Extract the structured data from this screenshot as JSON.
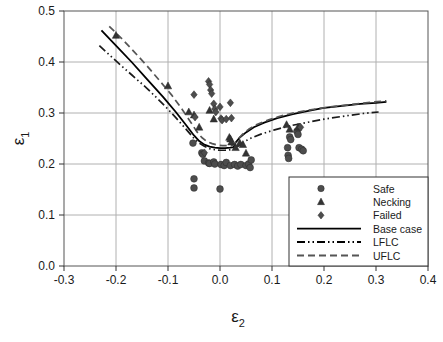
{
  "chart_data": {
    "type": "scatter",
    "title": "",
    "xlabel": "ε₂",
    "ylabel": "ε₁",
    "xlim": [
      -0.3,
      0.4
    ],
    "ylim": [
      0.0,
      0.5
    ],
    "xticks": [
      "-0.3",
      "-0.2",
      "-0.1",
      "0.0",
      "0.1",
      "0.2",
      "0.3",
      "0.4"
    ],
    "xtick_values": [
      -0.3,
      -0.2,
      -0.1,
      0.0,
      0.1,
      0.2,
      0.3,
      0.4
    ],
    "yticks": [
      "0.0",
      "0.1",
      "0.2",
      "0.3",
      "0.4",
      "0.5"
    ],
    "ytick_values": [
      0.0,
      0.1,
      0.2,
      0.3,
      0.4,
      0.5
    ],
    "grid": true,
    "legend_position": "lower-right",
    "series": [
      {
        "name": "Safe",
        "marker": "circle",
        "color": "#4d4d4d",
        "points": [
          [
            -0.052,
            0.241
          ],
          [
            -0.05,
            0.171
          ],
          [
            -0.05,
            0.153
          ],
          [
            -0.035,
            0.222
          ],
          [
            -0.033,
            0.219
          ],
          [
            -0.03,
            0.206
          ],
          [
            -0.022,
            0.202
          ],
          [
            -0.02,
            0.201
          ],
          [
            -0.012,
            0.204
          ],
          [
            -0.01,
            0.2
          ],
          [
            0.0,
            0.151
          ],
          [
            0.002,
            0.199
          ],
          [
            0.008,
            0.197
          ],
          [
            0.012,
            0.203
          ],
          [
            0.02,
            0.197
          ],
          [
            0.028,
            0.199
          ],
          [
            0.034,
            0.196
          ],
          [
            0.04,
            0.199
          ],
          [
            0.05,
            0.197
          ],
          [
            0.055,
            0.2
          ],
          [
            0.058,
            0.193
          ],
          [
            0.06,
            0.208
          ],
          [
            0.13,
            0.232
          ],
          [
            0.131,
            0.217
          ],
          [
            0.132,
            0.211
          ],
          [
            0.134,
            0.253
          ],
          [
            0.136,
            0.248
          ],
          [
            0.152,
            0.232
          ],
          [
            0.157,
            0.229
          ],
          [
            0.16,
            0.226
          ],
          [
            0.148,
            0.264
          ],
          [
            0.15,
            0.258
          ]
        ]
      },
      {
        "name": "Necking",
        "marker": "triangle",
        "color": "#333333",
        "points": [
          [
            -0.2,
            0.452
          ],
          [
            -0.1,
            0.353
          ],
          [
            -0.06,
            0.302
          ],
          [
            -0.05,
            0.296
          ],
          [
            -0.04,
            0.272
          ],
          [
            -0.02,
            0.305
          ],
          [
            -0.012,
            0.288
          ],
          [
            0.018,
            0.252
          ],
          [
            0.02,
            0.249
          ],
          [
            0.022,
            0.243
          ],
          [
            0.03,
            0.232
          ],
          [
            0.038,
            0.241
          ],
          [
            0.044,
            0.238
          ],
          [
            0.05,
            0.221
          ],
          [
            0.128,
            0.277
          ],
          [
            0.134,
            0.268
          ],
          [
            0.15,
            0.272
          ]
        ]
      },
      {
        "name": "Failed",
        "marker": "diamond",
        "color": "#4d4d4d",
        "points": [
          [
            -0.05,
            0.336
          ],
          [
            -0.048,
            0.292
          ],
          [
            -0.022,
            0.362
          ],
          [
            -0.02,
            0.356
          ],
          [
            -0.018,
            0.345
          ],
          [
            -0.016,
            0.338
          ],
          [
            -0.012,
            0.318
          ],
          [
            -0.01,
            0.308
          ],
          [
            -0.008,
            0.302
          ],
          [
            0.0,
            0.312
          ],
          [
            0.002,
            0.289
          ],
          [
            0.004,
            0.286
          ],
          [
            0.012,
            0.288
          ],
          [
            0.02,
            0.32
          ],
          [
            0.022,
            0.29
          ],
          [
            -0.03,
            0.222
          ],
          [
            0.155,
            0.272
          ]
        ]
      }
    ],
    "curves": [
      {
        "name": "Base case",
        "style": "solid",
        "color": "#000000",
        "points": [
          [
            -0.228,
            0.462
          ],
          [
            -0.2,
            0.432
          ],
          [
            -0.17,
            0.4
          ],
          [
            -0.14,
            0.366
          ],
          [
            -0.11,
            0.332
          ],
          [
            -0.085,
            0.302
          ],
          [
            -0.065,
            0.276
          ],
          [
            -0.05,
            0.256
          ],
          [
            -0.04,
            0.245
          ],
          [
            -0.03,
            0.238
          ],
          [
            -0.02,
            0.234
          ],
          [
            -0.01,
            0.232
          ],
          [
            0.0,
            0.231
          ],
          [
            0.01,
            0.231
          ],
          [
            0.02,
            0.232
          ],
          [
            0.026,
            0.233
          ],
          [
            0.03,
            0.242
          ],
          [
            0.038,
            0.252
          ],
          [
            0.05,
            0.262
          ],
          [
            0.065,
            0.272
          ],
          [
            0.085,
            0.281
          ],
          [
            0.11,
            0.29
          ],
          [
            0.14,
            0.298
          ],
          [
            0.17,
            0.304
          ],
          [
            0.2,
            0.31
          ],
          [
            0.235,
            0.314
          ],
          [
            0.27,
            0.318
          ],
          [
            0.3,
            0.32
          ],
          [
            0.32,
            0.322
          ]
        ]
      },
      {
        "name": "LFLC",
        "style": "dash-dot-dot",
        "color": "#1a1a1a",
        "points": [
          [
            -0.232,
            0.432
          ],
          [
            -0.2,
            0.402
          ],
          [
            -0.17,
            0.375
          ],
          [
            -0.14,
            0.348
          ],
          [
            -0.11,
            0.318
          ],
          [
            -0.085,
            0.291
          ],
          [
            -0.065,
            0.268
          ],
          [
            -0.05,
            0.25
          ],
          [
            -0.04,
            0.241
          ],
          [
            -0.03,
            0.235
          ],
          [
            -0.02,
            0.23
          ],
          [
            -0.01,
            0.228
          ],
          [
            0.0,
            0.227
          ],
          [
            0.01,
            0.227
          ],
          [
            0.02,
            0.228
          ],
          [
            0.028,
            0.23
          ],
          [
            0.035,
            0.235
          ],
          [
            0.045,
            0.243
          ],
          [
            0.06,
            0.251
          ],
          [
            0.08,
            0.259
          ],
          [
            0.105,
            0.267
          ],
          [
            0.135,
            0.275
          ],
          [
            0.165,
            0.281
          ],
          [
            0.2,
            0.288
          ],
          [
            0.24,
            0.294
          ],
          [
            0.275,
            0.299
          ],
          [
            0.305,
            0.302
          ]
        ]
      },
      {
        "name": "UFLC",
        "style": "dashed",
        "color": "#555555",
        "points": [
          [
            -0.213,
            0.47
          ],
          [
            -0.19,
            0.447
          ],
          [
            -0.165,
            0.42
          ],
          [
            -0.14,
            0.392
          ],
          [
            -0.115,
            0.362
          ],
          [
            -0.092,
            0.334
          ],
          [
            -0.072,
            0.306
          ],
          [
            -0.055,
            0.28
          ],
          [
            -0.045,
            0.264
          ],
          [
            -0.035,
            0.252
          ],
          [
            -0.025,
            0.244
          ],
          [
            -0.015,
            0.24
          ],
          [
            -0.005,
            0.237
          ],
          [
            0.005,
            0.236
          ],
          [
            0.015,
            0.236
          ],
          [
            0.025,
            0.237
          ],
          [
            0.032,
            0.245
          ],
          [
            0.042,
            0.257
          ],
          [
            0.055,
            0.268
          ],
          [
            0.072,
            0.278
          ],
          [
            0.095,
            0.287
          ],
          [
            0.12,
            0.295
          ],
          [
            0.15,
            0.302
          ],
          [
            0.185,
            0.308
          ],
          [
            0.22,
            0.313
          ],
          [
            0.255,
            0.317
          ],
          [
            0.29,
            0.321
          ],
          [
            0.32,
            0.324
          ]
        ]
      }
    ],
    "legend": {
      "entries": [
        {
          "label": "Safe",
          "type": "marker",
          "marker": "circle"
        },
        {
          "label": "Necking",
          "type": "marker",
          "marker": "triangle"
        },
        {
          "label": "Failed",
          "type": "marker",
          "marker": "diamond"
        },
        {
          "label": "Base case",
          "type": "line",
          "style": "solid"
        },
        {
          "label": "LFLC",
          "type": "line",
          "style": "dash-dot-dot"
        },
        {
          "label": "UFLC",
          "type": "line",
          "style": "dashed"
        }
      ]
    }
  }
}
